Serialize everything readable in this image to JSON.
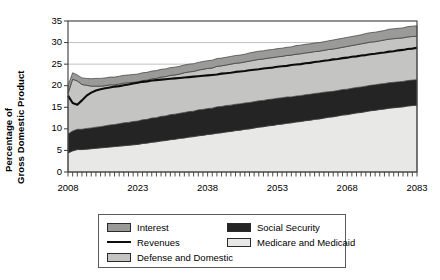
{
  "chart_data": {
    "type": "area",
    "title": "",
    "subtitle": "",
    "xlabel": "",
    "ylabel": "Percentage of Gross Domestic Product",
    "ylabel_lines": [
      "Percentage of",
      "Gross Domestic Product"
    ],
    "xlim": [
      2008,
      2083
    ],
    "ylim": [
      0,
      35
    ],
    "ytick_step": 5,
    "xtick_step": 15,
    "minor_xtick_step": 1,
    "grid": "horizontal",
    "legend_position": "below-center",
    "stacked": true,
    "ytick_labels": [
      "0",
      "5",
      "10",
      "15",
      "20",
      "25",
      "30",
      "35"
    ],
    "ytick_values": [
      0,
      5,
      10,
      15,
      20,
      25,
      30,
      35
    ],
    "xtick_labels": [
      "2008",
      "2023",
      "2038",
      "2053",
      "2068",
      "2083"
    ],
    "xtick_values": [
      2008,
      2023,
      2038,
      2053,
      2068,
      2083
    ],
    "x": [
      2008,
      2009,
      2010,
      2011,
      2012,
      2013,
      2014,
      2015,
      2016,
      2017,
      2018,
      2019,
      2020,
      2021,
      2022,
      2023,
      2024,
      2025,
      2026,
      2027,
      2028,
      2029,
      2030,
      2031,
      2032,
      2033,
      2034,
      2035,
      2036,
      2037,
      2038,
      2039,
      2040,
      2041,
      2042,
      2043,
      2044,
      2045,
      2046,
      2047,
      2048,
      2049,
      2050,
      2051,
      2052,
      2053,
      2054,
      2055,
      2056,
      2057,
      2058,
      2059,
      2060,
      2061,
      2062,
      2063,
      2064,
      2065,
      2066,
      2067,
      2068,
      2069,
      2070,
      2071,
      2072,
      2073,
      2074,
      2075,
      2076,
      2077,
      2078,
      2079,
      2080,
      2081,
      2082,
      2083
    ],
    "series": [
      {
        "name": "Medicare and Medicaid",
        "color": "#e8e8e6",
        "stack_order": 1,
        "values": [
          4.4,
          4.9,
          5.2,
          5.2,
          5.3,
          5.4,
          5.5,
          5.6,
          5.7,
          5.8,
          5.9,
          6.0,
          6.1,
          6.2,
          6.3,
          6.4,
          6.6,
          6.7,
          6.9,
          7.0,
          7.2,
          7.3,
          7.5,
          7.6,
          7.8,
          7.9,
          8.1,
          8.2,
          8.4,
          8.5,
          8.7,
          8.8,
          9.0,
          9.1,
          9.3,
          9.4,
          9.6,
          9.7,
          9.9,
          10.0,
          10.2,
          10.4,
          10.5,
          10.7,
          10.8,
          11.0,
          11.1,
          11.3,
          11.4,
          11.6,
          11.7,
          11.9,
          12.0,
          12.2,
          12.3,
          12.5,
          12.7,
          12.8,
          13.0,
          13.2,
          13.3,
          13.5,
          13.7,
          13.8,
          14.0,
          14.2,
          14.3,
          14.5,
          14.6,
          14.8,
          14.9,
          15.0,
          15.1,
          15.3,
          15.4,
          15.5
        ]
      },
      {
        "name": "Social Security",
        "color": "#242424",
        "stack_order": 2,
        "values": [
          4.4,
          4.6,
          4.7,
          4.7,
          4.8,
          4.8,
          4.9,
          4.9,
          5.0,
          5.1,
          5.1,
          5.2,
          5.3,
          5.3,
          5.4,
          5.4,
          5.5,
          5.5,
          5.6,
          5.6,
          5.7,
          5.7,
          5.8,
          5.8,
          5.8,
          5.9,
          5.9,
          5.9,
          6.0,
          6.0,
          6.0,
          6.0,
          6.1,
          6.1,
          6.1,
          6.1,
          6.1,
          6.1,
          6.1,
          6.1,
          6.1,
          6.1,
          6.1,
          6.1,
          6.1,
          6.1,
          6.1,
          6.1,
          6.0,
          6.0,
          6.0,
          6.0,
          6.0,
          6.0,
          6.0,
          6.0,
          5.9,
          5.9,
          5.9,
          5.9,
          5.9,
          5.9,
          5.9,
          5.9,
          5.9,
          5.9,
          5.9,
          5.9,
          5.9,
          5.9,
          5.9,
          5.9,
          5.9,
          5.9,
          5.9,
          5.9
        ]
      },
      {
        "name": "Defense and Domestic",
        "color": "#c4c4c2",
        "stack_order": 3,
        "values": [
          9.4,
          12.0,
          11.2,
          10.4,
          10.0,
          9.7,
          9.5,
          9.4,
          9.3,
          9.3,
          9.2,
          9.2,
          9.2,
          9.2,
          9.1,
          9.1,
          9.1,
          9.1,
          9.1,
          9.1,
          9.1,
          9.1,
          9.1,
          9.1,
          9.1,
          9.2,
          9.2,
          9.2,
          9.2,
          9.3,
          9.3,
          9.3,
          9.4,
          9.4,
          9.4,
          9.5,
          9.5,
          9.5,
          9.5,
          9.6,
          9.6,
          9.6,
          9.6,
          9.6,
          9.6,
          9.6,
          9.6,
          9.6,
          9.7,
          9.7,
          9.7,
          9.7,
          9.7,
          9.7,
          9.7,
          9.7,
          9.8,
          9.8,
          9.8,
          9.8,
          9.9,
          9.9,
          9.9,
          10.0,
          10.0,
          10.0,
          10.0,
          10.0,
          10.1,
          10.1,
          10.1,
          10.1,
          10.1,
          10.1,
          10.1,
          10.1
        ]
      },
      {
        "name": "Interest",
        "color": "#9a9a98",
        "stack_order": 4,
        "values": [
          1.8,
          1.5,
          1.4,
          1.5,
          1.6,
          1.7,
          1.8,
          1.8,
          1.8,
          1.8,
          1.8,
          1.8,
          1.8,
          1.8,
          1.8,
          1.8,
          1.8,
          1.8,
          1.8,
          1.8,
          1.8,
          1.8,
          1.8,
          1.8,
          1.8,
          1.8,
          1.8,
          1.8,
          1.8,
          1.8,
          1.8,
          1.8,
          1.8,
          1.8,
          1.8,
          1.8,
          1.8,
          1.8,
          1.8,
          1.9,
          1.9,
          1.9,
          1.9,
          1.9,
          1.9,
          1.9,
          1.9,
          1.9,
          1.9,
          2.0,
          2.0,
          2.0,
          2.0,
          2.0,
          2.0,
          2.0,
          2.0,
          2.1,
          2.1,
          2.1,
          2.1,
          2.1,
          2.1,
          2.1,
          2.2,
          2.2,
          2.2,
          2.2,
          2.2,
          2.3,
          2.3,
          2.3,
          2.3,
          2.4,
          2.4,
          2.4
        ]
      }
    ],
    "line_series": {
      "name": "Revenues",
      "color": "#0c0c0c",
      "values": [
        17.7,
        16.0,
        15.6,
        16.6,
        17.7,
        18.4,
        18.9,
        19.2,
        19.4,
        19.6,
        19.8,
        19.9,
        20.1,
        20.3,
        20.5,
        20.7,
        20.9,
        21.0,
        21.2,
        21.3,
        21.4,
        21.5,
        21.6,
        21.7,
        21.8,
        21.9,
        22.0,
        22.1,
        22.2,
        22.3,
        22.4,
        22.5,
        22.6,
        22.8,
        22.9,
        23.0,
        23.2,
        23.3,
        23.4,
        23.6,
        23.7,
        23.8,
        24.0,
        24.1,
        24.2,
        24.4,
        24.5,
        24.6,
        24.8,
        24.9,
        25.0,
        25.2,
        25.3,
        25.5,
        25.6,
        25.8,
        25.9,
        26.1,
        26.2,
        26.4,
        26.5,
        26.7,
        26.8,
        27.0,
        27.1,
        27.3,
        27.4,
        27.6,
        27.7,
        27.9,
        28.0,
        28.2,
        28.3,
        28.5,
        28.6,
        28.8
      ]
    },
    "legend": [
      {
        "label": "Interest",
        "type": "swatch",
        "color": "#9a9a98"
      },
      {
        "label": "Revenues",
        "type": "line",
        "color": "#0c0c0c"
      },
      {
        "label": "Defense and Domestic",
        "type": "swatch",
        "color": "#c4c4c2"
      },
      {
        "label": "Social Security",
        "type": "swatch",
        "color": "#242424"
      },
      {
        "label": "Medicare and Medicaid",
        "type": "swatch",
        "color": "#e8e8e6"
      }
    ]
  },
  "axis": {
    "ylabel_line1": "Percentage of",
    "ylabel_line2": "Gross Domestic Product",
    "y0": "0",
    "y5": "5",
    "y10": "10",
    "y15": "15",
    "y20": "20",
    "y25": "25",
    "y30": "30",
    "y35": "35",
    "x2008": "2008",
    "x2023": "2023",
    "x2038": "2038",
    "x2053": "2053",
    "x2068": "2068",
    "x2083": "2083"
  },
  "legend": {
    "interest": "Interest",
    "revenues": "Revenues",
    "defense": "Defense and Domestic",
    "social": "Social Security",
    "medical": "Medicare and Medicaid"
  }
}
